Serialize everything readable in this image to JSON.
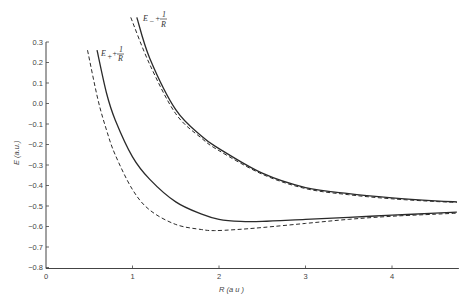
{
  "chart_data": {
    "type": "line",
    "title": "",
    "xlabel": "R (a.u.)",
    "ylabel": "E (a.u.)",
    "xlim": [
      0,
      4.75
    ],
    "ylim": [
      -0.8,
      0.3
    ],
    "grid": false,
    "legend_position": "inline labels on curves",
    "x_ticks": [
      "0",
      "1",
      "2",
      "3",
      "4"
    ],
    "y_ticks": [
      "0.3",
      "0.2",
      "0.1",
      "0.0",
      "-0.1",
      "-0.2",
      "-0.3",
      "-0.4",
      "-0.5",
      "-0.6",
      "-0.7",
      "-0.8"
    ],
    "annotations": [
      {
        "text": "E+ + 1/R",
        "near": "E+ curves, top left"
      },
      {
        "text": "E- + 1/R",
        "near": "E- curves, top"
      }
    ],
    "series": [
      {
        "name": "E+ + 1/R (solid)",
        "style": "solid",
        "x": [
          0.59,
          0.7,
          0.8,
          1.0,
          1.2,
          1.5,
          1.8,
          2.0,
          2.25,
          2.5,
          3.0,
          3.5,
          4.0,
          4.5,
          4.75
        ],
        "y": [
          0.26,
          0.05,
          -0.08,
          -0.26,
          -0.37,
          -0.48,
          -0.54,
          -0.565,
          -0.575,
          -0.575,
          -0.565,
          -0.555,
          -0.545,
          -0.535,
          -0.53
        ]
      },
      {
        "name": "E+ + 1/R (dashed)",
        "style": "dashed",
        "x": [
          0.48,
          0.6,
          0.7,
          0.8,
          1.0,
          1.2,
          1.5,
          1.8,
          1.95,
          2.2,
          2.5,
          3.0,
          3.5,
          4.0,
          4.5,
          4.75
        ],
        "y": [
          0.26,
          0.02,
          -0.13,
          -0.25,
          -0.42,
          -0.52,
          -0.59,
          -0.615,
          -0.62,
          -0.615,
          -0.605,
          -0.585,
          -0.565,
          -0.55,
          -0.54,
          -0.535
        ]
      },
      {
        "name": "E- + 1/R (solid)",
        "style": "solid",
        "x": [
          1.05,
          1.2,
          1.5,
          1.8,
          2.0,
          2.5,
          3.0,
          3.5,
          4.0,
          4.5,
          4.75
        ],
        "y": [
          0.42,
          0.22,
          -0.03,
          -0.16,
          -0.22,
          -0.34,
          -0.41,
          -0.44,
          -0.46,
          -0.475,
          -0.48
        ]
      },
      {
        "name": "E- + 1/R (dashed)",
        "style": "dashed",
        "x": [
          0.98,
          1.2,
          1.5,
          1.8,
          2.0,
          2.5,
          3.0,
          3.5,
          4.0,
          4.5,
          4.75
        ],
        "y": [
          0.42,
          0.19,
          -0.05,
          -0.17,
          -0.23,
          -0.345,
          -0.415,
          -0.445,
          -0.465,
          -0.478,
          -0.482
        ]
      }
    ]
  },
  "labels": {
    "x_axis_title": "R (a u )",
    "y_axis_title": "E (a.u.)",
    "eplus_label_main": "E",
    "eplus_label_sub": "+",
    "eplus_label_plus": "+",
    "eminus_label_main": "E",
    "eminus_label_sub": "−",
    "eminus_label_plus": "+",
    "frac_num": "1",
    "frac_den": "R"
  },
  "colors": {
    "ink": "#2a2a2a",
    "axis": "#444444",
    "background": "#ffffff"
  }
}
